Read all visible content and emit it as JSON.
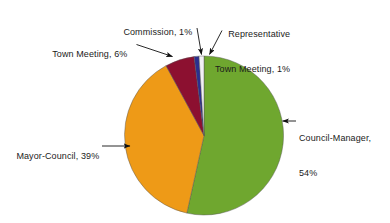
{
  "chart_data": {
    "type": "pie",
    "title": "",
    "subtitle": "",
    "xlabel": "",
    "ylabel": "",
    "legend_position": "none",
    "grid": false,
    "labels_placement": "outside-with-leader-lines",
    "start_angle_deg": 0,
    "direction": "clockwise",
    "background_color": "#FFFFFF",
    "categories": [
      "Council-Manager",
      "Mayor-Council",
      "Town Meeting",
      "Commission",
      "Representative Town Meeting"
    ],
    "values": [
      54,
      39,
      6,
      1,
      1
    ],
    "unit": "percent",
    "colors": [
      "#6FA72F",
      "#EE9A17",
      "#8C1030",
      "#2B2F8F",
      "#F2F0F5"
    ],
    "slices": [
      {
        "name": "Council-Manager",
        "value": 54,
        "color": "#6FA72F",
        "label_text": "Council-Manager,",
        "label_text_line2": "54%"
      },
      {
        "name": "Mayor-Council",
        "value": 39,
        "color": "#EE9A17",
        "label_text": "Mayor-Council, 39%"
      },
      {
        "name": "Town Meeting",
        "value": 6,
        "color": "#8C1030",
        "label_text": "Town Meeting, 6%"
      },
      {
        "name": "Commission",
        "value": 1,
        "color": "#2B2F8F",
        "label_text": "Commission, 1%"
      },
      {
        "name": "Representative Town Meeting",
        "value": 1,
        "color": "#F2F0F5",
        "label_text": "Representative",
        "label_text_line2": "Town Meeting, 1%"
      }
    ]
  },
  "labels": {
    "council_manager_line1": "Council-Manager,",
    "council_manager_line2": "54%",
    "mayor_council": "Mayor-Council, 39%",
    "town_meeting": "Town Meeting, 6%",
    "commission": "Commission, 1%",
    "rep_town_meeting_line1": "Representative",
    "rep_town_meeting_line2": "Town Meeting, 1%"
  }
}
